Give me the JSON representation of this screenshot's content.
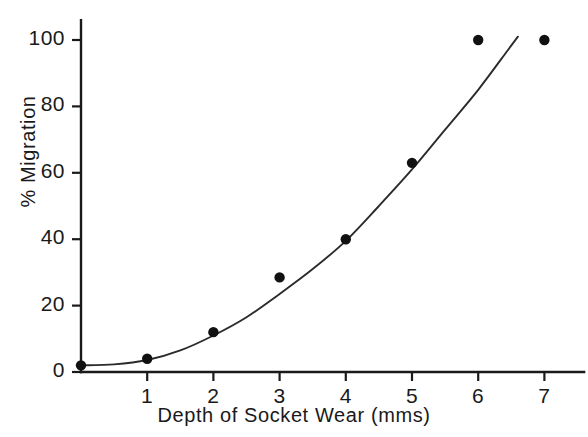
{
  "chart_data": {
    "type": "scatter",
    "title": "",
    "subtitle": "",
    "xlabel": "Depth of Socket Wear (mms)",
    "ylabel": "% Migration",
    "xlim": [
      0,
      7.6
    ],
    "ylim": [
      0,
      106
    ],
    "grid": false,
    "legend": null,
    "xticks": [
      1,
      2,
      3,
      4,
      5,
      6,
      7
    ],
    "xtick_labels": [
      "1",
      "2",
      "3",
      "4",
      "5",
      "6",
      "7"
    ],
    "yticks": [
      0,
      20,
      40,
      60,
      80,
      100
    ],
    "ytick_labels": [
      "0",
      "20",
      "40",
      "60",
      "80",
      "100"
    ],
    "x": [
      0,
      1,
      2,
      3,
      4,
      5,
      6,
      7
    ],
    "values": [
      2,
      4,
      12,
      28.5,
      40,
      63,
      100,
      100
    ],
    "series": [
      {
        "name": "observed",
        "marker": "filled-circle",
        "color": "#111111",
        "points": [
          {
            "x": 0,
            "y": 2
          },
          {
            "x": 1,
            "y": 4
          },
          {
            "x": 2,
            "y": 12
          },
          {
            "x": 3,
            "y": 28.5
          },
          {
            "x": 4,
            "y": 40
          },
          {
            "x": 5,
            "y": 63
          },
          {
            "x": 6,
            "y": 100
          },
          {
            "x": 7,
            "y": 100
          }
        ]
      },
      {
        "name": "fitted-curve",
        "marker": "none",
        "color": "#2b2b2b",
        "points": [
          {
            "x": 0,
            "y": 2
          },
          {
            "x": 0.5,
            "y": 2.3
          },
          {
            "x": 1,
            "y": 3.6
          },
          {
            "x": 1.5,
            "y": 6.5
          },
          {
            "x": 2,
            "y": 11
          },
          {
            "x": 2.5,
            "y": 16.5
          },
          {
            "x": 3,
            "y": 23.5
          },
          {
            "x": 3.5,
            "y": 31
          },
          {
            "x": 4,
            "y": 39.5
          },
          {
            "x": 4.5,
            "y": 50
          },
          {
            "x": 5,
            "y": 61
          },
          {
            "x": 5.5,
            "y": 73
          },
          {
            "x": 6,
            "y": 85
          },
          {
            "x": 6.45,
            "y": 97
          },
          {
            "x": 6.6,
            "y": 101
          }
        ]
      }
    ]
  },
  "axes": {
    "x_axis_name": "x-axis",
    "y_axis_name": "y-axis"
  }
}
